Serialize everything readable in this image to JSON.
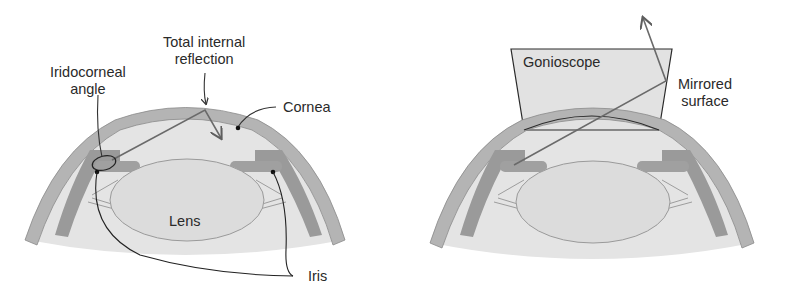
{
  "diagram": {
    "left_panel": {
      "labels": {
        "total_internal_reflection_line1": "Total internal",
        "total_internal_reflection_line2": "reflection",
        "iridocorneal_line1": "Iridocorneal",
        "iridocorneal_line2": "angle",
        "cornea": "Cornea",
        "lens": "Lens",
        "iris": "Iris"
      }
    },
    "right_panel": {
      "labels": {
        "gonioscope": "Gonioscope",
        "mirrored_line1": "Mirrored",
        "mirrored_line2": "surface"
      }
    },
    "colors": {
      "background": "#ffffff",
      "vitreous": "#e4e4e4",
      "cornea": "#b4b4b4",
      "ciliary": "#9a9a9a",
      "lens": "#dcdcdc",
      "gonioscope": "#e2e2e2",
      "ray": "#6a6a6a",
      "text": "#2a2a2a"
    }
  }
}
